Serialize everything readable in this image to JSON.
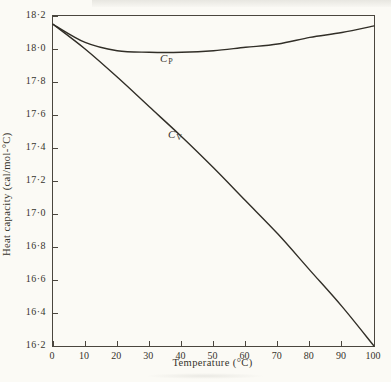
{
  "figure": {
    "background": "#fbfaf5",
    "line_color": "#312e27",
    "axis_color": "#4a463e",
    "text_color": "#36332c"
  },
  "chart_data": {
    "type": "line",
    "title": "",
    "xlabel": "Temperature (°C)",
    "ylabel": "Heat capacity (cal/mol-°C)",
    "xlim": [
      0,
      100
    ],
    "ylim": [
      16.2,
      18.2
    ],
    "grid": false,
    "legend_position": "inline-curve-labels",
    "x_tick_values": [
      0,
      10,
      20,
      30,
      40,
      50,
      60,
      70,
      80,
      90,
      100
    ],
    "x_tick_labels": [
      "0",
      "10",
      "20",
      "30",
      "40",
      "50",
      "60",
      "70",
      "80",
      "90",
      "100"
    ],
    "y_tick_values": [
      18.2,
      18.0,
      17.8,
      17.6,
      17.4,
      17.2,
      17.0,
      16.8,
      16.6,
      16.4,
      16.2
    ],
    "y_tick_labels": [
      "18·2",
      "18·0",
      "17·8",
      "17·6",
      "17·4",
      "17·2",
      "17·0",
      "16·8",
      "16·6",
      "16·4",
      "16·2"
    ],
    "x": [
      0,
      10,
      20,
      30,
      40,
      50,
      60,
      70,
      80,
      90,
      100
    ],
    "series": [
      {
        "key": "cp",
        "name": "CP",
        "label_main": "C",
        "label_sub": "P",
        "values": [
          18.15,
          18.04,
          17.99,
          17.98,
          17.98,
          17.99,
          18.01,
          18.03,
          18.07,
          18.1,
          18.14
        ]
      },
      {
        "key": "cv",
        "name": "CV",
        "label_main": "C",
        "label_sub": "V",
        "values": [
          18.15,
          18.0,
          17.83,
          17.65,
          17.47,
          17.28,
          17.08,
          16.88,
          16.66,
          16.44,
          16.2
        ]
      }
    ]
  }
}
